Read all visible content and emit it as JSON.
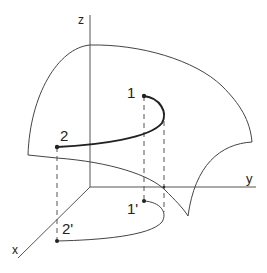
{
  "diagram": {
    "type": "3d-surface-path-projection",
    "axes": {
      "z_label": "z",
      "y_label": "y",
      "x_label": "x"
    },
    "points": {
      "p1_label": "1",
      "p2_label": "2",
      "p1_proj_label": "1'",
      "p2_proj_label": "2'"
    },
    "colors": {
      "line": "#333333",
      "path": "#222222",
      "background": "#ffffff"
    }
  }
}
